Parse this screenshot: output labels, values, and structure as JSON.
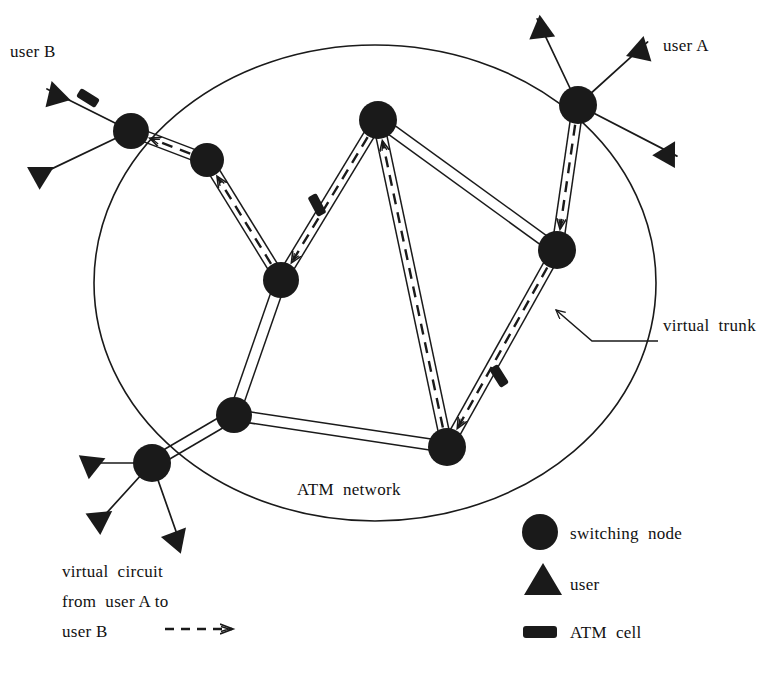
{
  "figure": {
    "kind": "network-diagram",
    "title_in_image": "ATM network",
    "ink_color": "#1a1a1a",
    "background_color": "#ffffff"
  },
  "labels": {
    "user_b": "user B",
    "user_a": "user A",
    "virtual_trunk": "virtual  trunk",
    "atm_network": "ATM  network",
    "virtual_circuit_line1": "virtual  circuit",
    "virtual_circuit_line2": "from  user A to",
    "virtual_circuit_line3": "user B"
  },
  "legend": {
    "items": [
      {
        "symbol": "circle",
        "icon_name": "switching-node-icon",
        "label": "switching  node"
      },
      {
        "symbol": "triangle",
        "icon_name": "user-icon",
        "label": "user"
      },
      {
        "symbol": "rounded-rect",
        "icon_name": "atm-cell-icon",
        "label": "ATM  cell"
      },
      {
        "symbol": "dashed-arrow",
        "icon_name": "virtual-circuit-arrow-icon",
        "label": "virtual circuit arrow"
      }
    ]
  },
  "network_boundary": {
    "shape": "ellipse",
    "cx": 375,
    "cy": 283,
    "rx": 281,
    "ry": 238
  },
  "nodes": [
    {
      "id": "n_b",
      "name": "node-user-b-edge",
      "x": 131,
      "y": 131,
      "r": 18
    },
    {
      "id": "n_nw",
      "name": "node-northwest",
      "x": 207,
      "y": 160,
      "r": 17
    },
    {
      "id": "n_c",
      "name": "node-center-left",
      "x": 281,
      "y": 280,
      "r": 18
    },
    {
      "id": "n_t",
      "name": "node-top-center",
      "x": 378,
      "y": 120,
      "r": 19
    },
    {
      "id": "n_a",
      "name": "node-user-a-edge",
      "x": 578,
      "y": 105,
      "r": 19
    },
    {
      "id": "n_e",
      "name": "node-east",
      "x": 557,
      "y": 250,
      "r": 19
    },
    {
      "id": "n_sw",
      "name": "node-southwest",
      "x": 234,
      "y": 415,
      "r": 18
    },
    {
      "id": "n_se",
      "name": "node-southeast",
      "x": 447,
      "y": 447,
      "r": 19
    },
    {
      "id": "n_bl",
      "name": "node-bottom-left-edge",
      "x": 152,
      "y": 463,
      "r": 19
    }
  ],
  "users": [
    {
      "name": "user-triangle-b-top",
      "x": 55,
      "y": 93,
      "attach": "n_b"
    },
    {
      "name": "user-triangle-b-bottom",
      "x": 43,
      "y": 173,
      "attach": "n_b"
    },
    {
      "name": "user-triangle-a-left",
      "x": 541,
      "y": 27,
      "attach": "n_a"
    },
    {
      "name": "user-triangle-a-right",
      "x": 641,
      "y": 48,
      "attach": "n_a"
    },
    {
      "name": "user-triangle-a-low",
      "x": 669,
      "y": 152,
      "attach": "n_a"
    },
    {
      "name": "user-triangle-bl-left",
      "x": 94,
      "y": 463,
      "attach": "n_bl"
    },
    {
      "name": "user-triangle-bl-mid",
      "x": 102,
      "y": 518,
      "attach": "n_bl"
    },
    {
      "name": "user-triangle-bl-right",
      "x": 178,
      "y": 537,
      "attach": "n_bl"
    }
  ],
  "trunks": [
    {
      "from": "n_b",
      "to": "n_nw"
    },
    {
      "from": "n_nw",
      "to": "n_c"
    },
    {
      "from": "n_c",
      "to": "n_t"
    },
    {
      "from": "n_t",
      "to": "n_e"
    },
    {
      "from": "n_a",
      "to": "n_e"
    },
    {
      "from": "n_e",
      "to": "n_se"
    },
    {
      "from": "n_t",
      "to": "n_se"
    },
    {
      "from": "n_c",
      "to": "n_sw"
    },
    {
      "from": "n_sw",
      "to": "n_se"
    },
    {
      "from": "n_sw",
      "to": "n_bl"
    }
  ],
  "virtual_circuit": {
    "direction": "from user A to user B",
    "style": "dashed-with-arrowheads",
    "path_nodes": [
      "n_a",
      "n_e",
      "n_se",
      "n_t",
      "n_c",
      "n_nw",
      "n_b"
    ]
  },
  "atm_cells": [
    {
      "name": "atm-cell-on-user-b-link",
      "x": 88,
      "y": 98,
      "angle": 32
    },
    {
      "name": "atm-cell-on-trunk-c-t",
      "x": 317,
      "y": 205,
      "angle": 62
    },
    {
      "name": "atm-cell-on-trunk-e-se",
      "x": 499,
      "y": 376,
      "angle": 58
    }
  ],
  "trunk_callout": {
    "name": "virtual-trunk-leader",
    "arrow_tip_x": 556,
    "arrow_tip_y": 310,
    "elbow_x": 592,
    "elbow_y": 341,
    "end_x": 658,
    "end_y": 341
  }
}
